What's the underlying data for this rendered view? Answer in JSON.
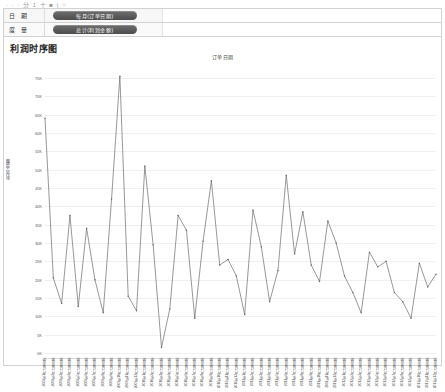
{
  "top_stray_text": "· · · 分 1 十 ■ ( ○",
  "filters": {
    "rows": [
      {
        "label": "日 期",
        "pill": "每月(订单日期)"
      },
      {
        "label": "度 量",
        "pill": "总计(利润金额)"
      }
    ]
  },
  "card": {
    "title": "利润时序图"
  },
  "chart_data": {
    "type": "line",
    "title": "订单日期",
    "xlabel": "",
    "ylabel": "利润金额",
    "ylim": [
      0,
      78000
    ],
    "ytick_values": [
      75000,
      70000,
      65000,
      60000,
      55000,
      50000,
      45000,
      40000,
      35000,
      30000,
      25000,
      20000,
      15000,
      10000,
      5000,
      0
    ],
    "ytick_labels": [
      "75K",
      "70K",
      "65K",
      "60K",
      "55K",
      "50K",
      "45K",
      "40K",
      "35K",
      "30K",
      "25K",
      "20K",
      "15K",
      "10K",
      "5K",
      "0K"
    ],
    "grid": true,
    "legend": false,
    "categories": [
      "2009年1月 订单日期",
      "2009年2月 订单日期",
      "2009年3月 订单日期",
      "2009年4月 订单日期",
      "2009年5月 订单日期",
      "2009年6月 订单日期",
      "2009年7月 订单日期",
      "2009年8月 订单日期",
      "2009年9月 订单日期",
      "2009年10月 订单日期",
      "2009年11月 订单日期",
      "2009年12月 订单日期",
      "2010年1月 订单日期",
      "2010年2月 订单日期",
      "2010年3月 订单日期",
      "2010年4月 订单日期",
      "2010年5月 订单日期",
      "2010年6月 订单日期",
      "2010年7月 订单日期",
      "2010年8月 订单日期",
      "2010年9月 订单日期",
      "2010年10月 订单日期",
      "2010年11月 订单日期",
      "2010年12月 订单日期",
      "2011年1月 订单日期",
      "2011年2月 订单日期",
      "2011年3月 订单日期",
      "2011年4月 订单日期",
      "2011年5月 订单日期",
      "2011年6月 订单日期",
      "2011年7月 订单日期",
      "2011年8月 订单日期",
      "2011年9月 订单日期",
      "2011年10月 订单日期",
      "2011年11月 订单日期",
      "2011年12月 订单日期",
      "2012年1月 订单日期",
      "2012年2月 订单日期",
      "2012年3月 订单日期",
      "2012年4月 订单日期",
      "2012年5月 订单日期",
      "2012年6月 订单日期",
      "2012年7月 订单日期",
      "2012年8月 订单日期",
      "2012年9月 订单日期",
      "2012年10月 订单日期",
      "2012年11月 订单日期",
      "2012年12月 订单日期"
    ],
    "values": [
      64000,
      20500,
      13500,
      37500,
      12700,
      34000,
      20000,
      11000,
      42000,
      75500,
      15500,
      11500,
      51000,
      29500,
      1500,
      12000,
      37500,
      33500,
      9500,
      30500,
      47000,
      24000,
      25500,
      21000,
      10500,
      39000,
      29000,
      14000,
      22500,
      48500,
      27000,
      38500,
      24000,
      19500,
      36000,
      30000,
      21000,
      16500,
      11000,
      27500,
      23500,
      25000,
      16500,
      14000,
      9500,
      24500,
      18000,
      21500
    ],
    "series_color": "#6b6b6b"
  }
}
